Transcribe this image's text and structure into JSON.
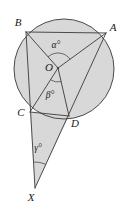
{
  "figure": {
    "background_color": "#ffffff",
    "fill_color": "#d8d8d8",
    "stroke_color": "#3a3a3a",
    "circle_stroke_color": "#4a4a4a",
    "labels": {
      "A": "A",
      "B": "B",
      "C": "C",
      "D": "D",
      "O": "O",
      "X": "X",
      "alpha": "α°",
      "beta": "β°",
      "gamma": "γ°"
    },
    "points": {
      "A": {
        "x": 106,
        "y": 33
      },
      "B": {
        "x": 26,
        "y": 32
      },
      "C": {
        "x": 30,
        "y": 112
      },
      "D": {
        "x": 69,
        "y": 116
      },
      "O": {
        "x": 58,
        "y": 68
      },
      "X": {
        "x": 35,
        "y": 188
      }
    },
    "label_positions": {
      "A": {
        "x": 113,
        "y": 31
      },
      "B": {
        "x": 18,
        "y": 26
      },
      "C": {
        "x": 21,
        "y": 116
      },
      "D": {
        "x": 75,
        "y": 127
      },
      "O": {
        "x": 49,
        "y": 71
      },
      "X": {
        "x": 31,
        "y": 201
      },
      "alpha": {
        "x": 56,
        "y": 48
      },
      "beta": {
        "x": 50,
        "y": 98
      },
      "gamma": {
        "x": 38,
        "y": 151
      }
    },
    "circle": {
      "cx": 64,
      "cy": 69,
      "r": 50
    },
    "segments": [
      {
        "name": "BA",
        "from": "B",
        "to": "A"
      },
      {
        "name": "BO",
        "from": "B",
        "to": "O"
      },
      {
        "name": "AO",
        "from": "A",
        "to": "O"
      },
      {
        "name": "OD",
        "from": "O",
        "to": "D"
      },
      {
        "name": "OC",
        "from": "O",
        "to": "C"
      },
      {
        "name": "BC-extended-to-X",
        "from": "B",
        "to": "X"
      },
      {
        "name": "AD-extended-to-X",
        "from": "A",
        "to": "X"
      },
      {
        "name": "CD",
        "from": "C",
        "to": "D"
      }
    ],
    "angles": [
      {
        "name": "alpha",
        "vertex": "O",
        "between": [
          "B",
          "A"
        ],
        "label": "α°"
      },
      {
        "name": "beta",
        "vertex": "O",
        "between": [
          "C",
          "D"
        ],
        "label": "β°"
      },
      {
        "name": "gamma",
        "vertex": "X",
        "between": [
          "B",
          "A"
        ],
        "label": "γ°"
      }
    ]
  }
}
